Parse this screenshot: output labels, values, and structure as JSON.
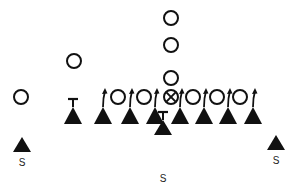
{
  "diagram": {
    "type": "football-play",
    "colors": {
      "ink": "#111111",
      "background": "#ffffff"
    },
    "offense": [
      {
        "role": "back",
        "x": 171,
        "y": 18
      },
      {
        "role": "back",
        "x": 171,
        "y": 45
      },
      {
        "role": "back",
        "x": 171,
        "y": 78
      },
      {
        "role": "wing",
        "x": 74,
        "y": 61
      },
      {
        "role": "split-end",
        "x": 21,
        "y": 97
      },
      {
        "role": "lineman",
        "x": 118,
        "y": 97
      },
      {
        "role": "lineman",
        "x": 144,
        "y": 97
      },
      {
        "role": "center",
        "x": 171,
        "y": 97,
        "marker": "crossed-circle"
      },
      {
        "role": "lineman",
        "x": 193,
        "y": 97
      },
      {
        "role": "lineman",
        "x": 217,
        "y": 97
      },
      {
        "role": "lineman",
        "x": 240,
        "y": 97
      }
    ],
    "defense_line": [
      {
        "x": 73,
        "stem": "t-bar"
      },
      {
        "x": 103,
        "stem": "arrow"
      },
      {
        "x": 130,
        "stem": "arrow"
      },
      {
        "x": 155,
        "stem": "arrow"
      },
      {
        "x": 180,
        "stem": "arrow"
      },
      {
        "x": 204,
        "stem": "arrow"
      },
      {
        "x": 228,
        "stem": "arrow"
      },
      {
        "x": 253,
        "stem": "arrow"
      }
    ],
    "safeties": [
      {
        "x": 22,
        "y": 145,
        "label": "S"
      },
      {
        "x": 163,
        "y": 128,
        "label": "S",
        "stem": "t-bar"
      },
      {
        "x": 276,
        "y": 143,
        "label": "S"
      }
    ]
  }
}
